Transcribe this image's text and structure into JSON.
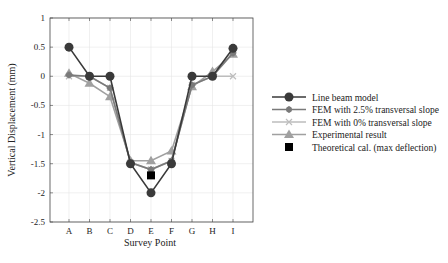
{
  "chart_data": {
    "type": "line",
    "title": "",
    "xlabel": "Survey Point",
    "ylabel": "Vertical Displacement (mm)",
    "categories": [
      "A",
      "B",
      "C",
      "D",
      "E",
      "F",
      "G",
      "H",
      "I"
    ],
    "ylim": [
      -2.5,
      1
    ],
    "yticks": [
      "1",
      "0.5",
      "0",
      "-0.5",
      "-1",
      "-1.5",
      "-2",
      "-2.5"
    ],
    "grid": true,
    "legend_position": "right",
    "series": [
      {
        "name": "Line beam model",
        "color": "#3a3a3a",
        "marker": "circle",
        "values": [
          0.5,
          0.0,
          0.0,
          -1.5,
          -2.0,
          -1.5,
          0.0,
          0.0,
          0.48
        ]
      },
      {
        "name": "FEM with 2.5% transversal slope",
        "color": "#7a7a7a",
        "marker": "star",
        "values": [
          0.02,
          0.0,
          -0.2,
          -1.48,
          -1.6,
          -1.45,
          -0.15,
          0.0,
          0.4
        ]
      },
      {
        "name": "FEM with 0% transversal slope",
        "color": "#bdbdbd",
        "marker": "x",
        "values": [
          0.0,
          0.0,
          -0.2,
          -1.48,
          -1.6,
          -1.45,
          -0.15,
          0.0,
          0.0
        ]
      },
      {
        "name": "Experimental result",
        "color": "#a0a0a0",
        "marker": "triangle",
        "values": [
          0.05,
          -0.12,
          -0.35,
          -1.45,
          -1.45,
          -1.28,
          -0.18,
          0.08,
          0.38
        ]
      },
      {
        "name": "Theoretical cal. (max deflection)",
        "color": "#000000",
        "marker": "square",
        "points": [
          {
            "x": "E",
            "y": -1.7
          }
        ]
      }
    ]
  }
}
